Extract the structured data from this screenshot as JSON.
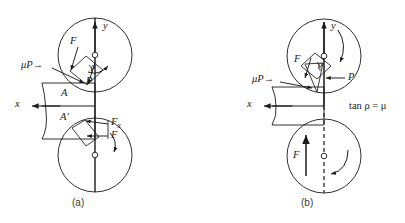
{
  "figure": {
    "type": "engineering-mechanics-diagram",
    "background_color": "#ffffff",
    "line_color": "#1a1a1a",
    "caption_color": "#3a3a3a"
  },
  "panel_a": {
    "caption": "(a)",
    "labels": {
      "y_axis": "y",
      "x_axis": "x",
      "force_F_upper": "F",
      "normal_P": "P",
      "friction_muP": "μP→",
      "friction_angle_rho": "ρ",
      "point_A": "A",
      "point_A_prime": "A′",
      "force_Fx_lower": "F",
      "force_Fx_lower_sub": "x",
      "force_F_lower": "F"
    },
    "geometry": {
      "upper_circle_center": [
        95,
        55
      ],
      "upper_circle_radius": 37,
      "lower_circle_center": [
        95,
        155
      ],
      "lower_circle_radius": 37,
      "contact_point": [
        95,
        105
      ]
    }
  },
  "panel_b": {
    "caption": "(b)",
    "labels": {
      "y_axis": "y",
      "x_axis": "x",
      "force_F_upper": "F",
      "normal_P": "P",
      "friction_muP": "μP→",
      "friction_angle_rho": "ρ",
      "force_F_lower": "F"
    },
    "equation": {
      "text": "tan ρ = μ",
      "lhs_function": "tan",
      "lhs_variable": "ρ",
      "relation": "=",
      "rhs": "μ"
    },
    "geometry": {
      "upper_circle_center": [
        324,
        56
      ],
      "upper_circle_radius": 37,
      "lower_circle_center": [
        324,
        156
      ],
      "lower_circle_radius": 37,
      "contact_point": [
        324,
        106
      ]
    }
  },
  "icons": {
    "arrowhead": "arrowhead-icon",
    "pivot": "pivot-circle-icon",
    "rotation_arrow": "curved-rotation-arrow-icon",
    "dashed_centerline": "dashed-centerline-icon"
  }
}
